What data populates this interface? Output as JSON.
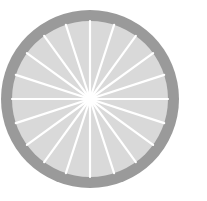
{
  "wheel": {
    "icon": "wheel-icon",
    "center": [
      90,
      99
    ],
    "outer_radius": 89,
    "inner_radius": 78,
    "spoke_count": 20,
    "colors": {
      "background": "#ffffff",
      "rim": "#9a9a9a",
      "disc": "#d9d9d9",
      "spoke": "#ffffff"
    }
  }
}
